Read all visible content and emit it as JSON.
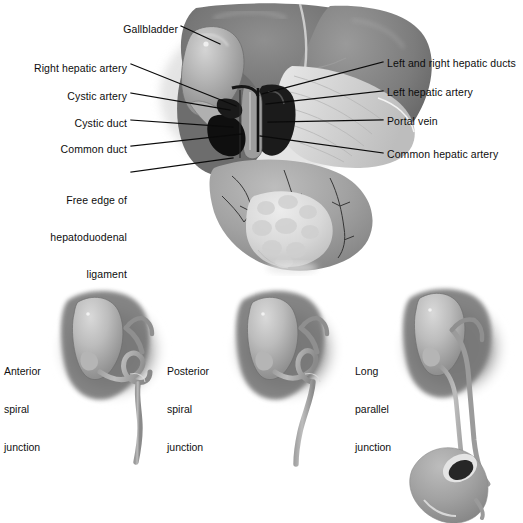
{
  "figure": {
    "type": "medical-anatomy-illustration",
    "rendering": "grayscale airbrush / halftone textbook plate",
    "background_color": "#ffffff"
  },
  "main_diagram": {
    "labels_left": [
      {
        "id": "gallbladder",
        "text": "Gallbladder",
        "lines": [
          "Gallbladder"
        ]
      },
      {
        "id": "right-hepatic-artery",
        "text": "Right hepatic artery",
        "lines": [
          "Right hepatic artery"
        ]
      },
      {
        "id": "cystic-artery",
        "text": "Cystic artery",
        "lines": [
          "Cystic artery"
        ]
      },
      {
        "id": "cystic-duct",
        "text": "Cystic duct",
        "lines": [
          "Cystic duct"
        ]
      },
      {
        "id": "common-duct",
        "text": "Common duct",
        "lines": [
          "Common duct"
        ]
      },
      {
        "id": "free-edge",
        "text": "Free edge of hepatoduodenal ligament",
        "lines": [
          "Free edge of",
          "hepatoduodenal",
          "ligament"
        ]
      }
    ],
    "labels_right": [
      {
        "id": "hepatic-ducts",
        "text": "Left and right hepatic ducts",
        "lines": [
          "Left and right hepatic ducts"
        ]
      },
      {
        "id": "left-hepatic-artery",
        "text": "Left hepatic artery",
        "lines": [
          "Left hepatic artery"
        ]
      },
      {
        "id": "portal-vein",
        "text": "Portal vein",
        "lines": [
          "Portal vein"
        ]
      },
      {
        "id": "common-hepatic-artery",
        "text": "Common hepatic artery",
        "lines": [
          "Common hepatic artery"
        ]
      }
    ],
    "structures_depicted": [
      "liver",
      "gallbladder",
      "cystic duct",
      "common bile duct",
      "portal vein",
      "hepatic artery",
      "duodenum",
      "pancreas"
    ]
  },
  "variant_panels": [
    {
      "id": "anterior-spiral",
      "lines": [
        "Anterior",
        "spiral",
        "junction"
      ],
      "text": "Anterior spiral junction"
    },
    {
      "id": "posterior-spiral",
      "lines": [
        "Posterior",
        "spiral",
        "junction"
      ],
      "text": "Posterior spiral junction"
    },
    {
      "id": "long-parallel",
      "lines": [
        "Long",
        "parallel",
        "junction"
      ],
      "text": "Long parallel junction"
    }
  ],
  "colors": {
    "ink": "#0d0d0d",
    "liver_dark": "#6e6e6e",
    "liver_mid": "#8d8d8d",
    "gallbladder": "#b9b9b9",
    "duct_black": "#121212",
    "pancreas": "#dcdcdc",
    "duodenum": "#a9a9a9",
    "background": "#ffffff"
  }
}
